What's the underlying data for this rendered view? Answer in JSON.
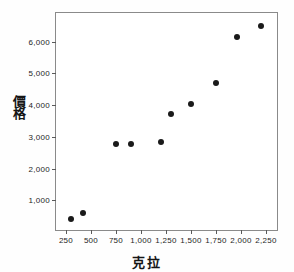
{
  "chart_data": {
    "type": "scatter",
    "title": "",
    "xlabel": "克拉",
    "ylabel": "價格",
    "xlim": [
      150,
      2380
    ],
    "ylim": [
      0,
      6900
    ],
    "grid": false,
    "legend": null,
    "xticks": [
      250,
      500,
      750,
      1000,
      1250,
      1500,
      1750,
      2000,
      2250
    ],
    "xtick_labels": [
      "250",
      "500",
      "750",
      "1,000",
      "1,250",
      "1,500",
      "1,750",
      "2,000",
      "2,250"
    ],
    "yticks": [
      1000,
      2000,
      3000,
      4000,
      5000,
      6000
    ],
    "ytick_labels": [
      "1,000",
      "2,000",
      "3,000",
      "4,000",
      "5,000",
      "6,000"
    ],
    "marker": "filled-circle",
    "marker_color": "#1a1a1a",
    "points": [
      {
        "x": 300,
        "y": 400
      },
      {
        "x": 420,
        "y": 600
      },
      {
        "x": 750,
        "y": 2780
      },
      {
        "x": 900,
        "y": 2780
      },
      {
        "x": 1200,
        "y": 2820
      },
      {
        "x": 1300,
        "y": 3720
      },
      {
        "x": 1500,
        "y": 4030
      },
      {
        "x": 1750,
        "y": 4680
      },
      {
        "x": 1960,
        "y": 6130
      },
      {
        "x": 2200,
        "y": 6500
      }
    ]
  },
  "axes": {
    "frame_color": "#8a8a8a",
    "tick_color": "#5a5a5a",
    "text_color": "#1d1d1d"
  }
}
